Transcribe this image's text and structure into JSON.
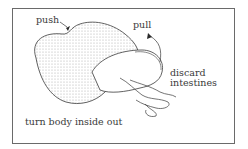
{
  "diagram": {
    "labels": {
      "push": "push",
      "pull": "pull",
      "discard_line1": "discard",
      "discard_line2": "intestines",
      "caption": "turn body inside out"
    },
    "colors": {
      "stroke": "#3a3a3a",
      "frame": "#6a6a6a",
      "stipple": "#9a9a9a"
    }
  }
}
